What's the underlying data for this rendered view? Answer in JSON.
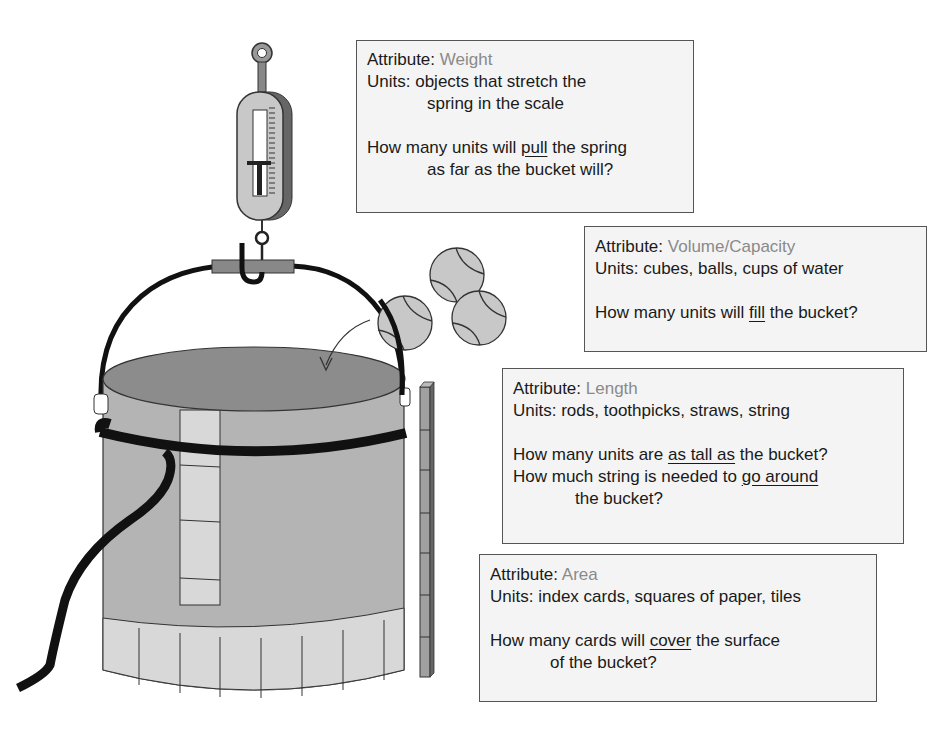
{
  "boxes": {
    "weight": {
      "attr_label": "Attribute:",
      "attr_value": "Weight",
      "units_label": "Units:",
      "units_line1": "objects that stretch the",
      "units_line2": "spring in the scale",
      "q_pre": "How many units will ",
      "q_key": "pull",
      "q_post": " the spring",
      "q_line2": "as far as the bucket will?"
    },
    "volume": {
      "attr_label": "Attribute:",
      "attr_value": "Volume/Capacity",
      "units_label": "Units:",
      "units_line1": "cubes, balls, cups of water",
      "q_pre": "How many units will ",
      "q_key": "fill",
      "q_post": " the bucket?"
    },
    "length": {
      "attr_label": "Attribute:",
      "attr_value": "Length",
      "units_label": "Units:",
      "units_line1": "rods, toothpicks, straws, string",
      "q1_pre": "How many units are ",
      "q1_key": "as tall as",
      "q1_post": " the bucket?",
      "q2_pre": "How much string is needed to ",
      "q2_key": "go around",
      "q2_line2": "the bucket?"
    },
    "area": {
      "attr_label": "Attribute:",
      "attr_value": "Area",
      "units_label": "Units:",
      "units_line1": "index cards, squares of paper, tiles",
      "q_pre": "How many cards will ",
      "q_key": "cover",
      "q_post": " the surface",
      "q_line2": "of the bucket?"
    }
  },
  "illustration": {
    "objects": [
      "spring-scale",
      "bucket",
      "tennis-balls",
      "rod-stack",
      "string",
      "index-card-tiles"
    ],
    "colors": {
      "bucket_side": "#b4b4b4",
      "bucket_top": "#8c8c8c",
      "tile": "#d8d8d8",
      "ball": "#c8c8c8",
      "attribute_value": "#8a8a8a",
      "box_bg": "#f4f4f4"
    }
  }
}
